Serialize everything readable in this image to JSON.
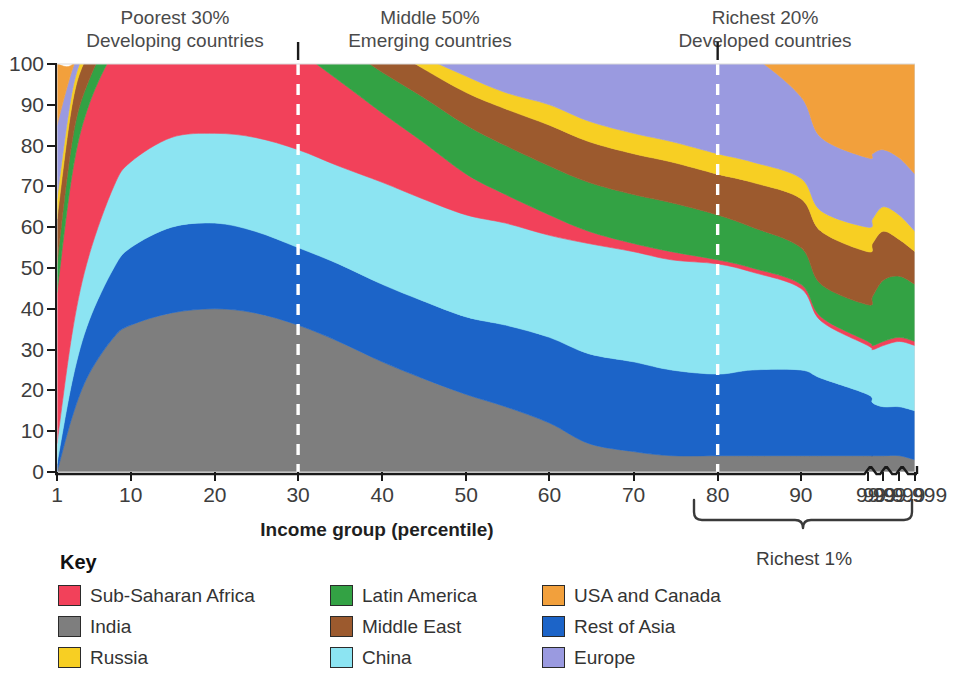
{
  "regions": [
    {
      "id": "poorest",
      "line1": "Poorest 30%",
      "line2": "Developing countries",
      "center_pct": 15
    },
    {
      "id": "middle",
      "line1": "Middle 50%",
      "line2": "Emerging countries",
      "center_pct": 55
    },
    {
      "id": "richest",
      "line1": "Richest 20%",
      "line2": "Developed countries",
      "center_pct": 90
    }
  ],
  "axis": {
    "x_title": "Income group (percentile)",
    "bracket_label": "Richest 1%"
  },
  "key": {
    "title": "Key",
    "items": [
      {
        "label": "Sub-Saharan Africa",
        "color": "#f2415a"
      },
      {
        "label": "Latin America",
        "color": "#33a244"
      },
      {
        "label": "USA and Canada",
        "color": "#f2a03c"
      },
      {
        "label": "India",
        "color": "#7e7e7e"
      },
      {
        "label": "Middle East",
        "color": "#9c5a2e"
      },
      {
        "label": "Rest of Asia",
        "color": "#1c64c8"
      },
      {
        "label": "Russia",
        "color": "#f7cf23"
      },
      {
        "label": "China",
        "color": "#8ce4f2"
      },
      {
        "label": "Europe",
        "color": "#9a9ae0"
      }
    ]
  },
  "chart_data": {
    "type": "area",
    "title": "",
    "subtitle": "",
    "xlabel": "Income group (percentile)",
    "ylabel": "",
    "ylim": [
      0,
      100
    ],
    "grid": false,
    "legend_position": "below",
    "stacked": true,
    "stack_total": 100,
    "x_tick_labels": [
      "1",
      "10",
      "20",
      "30",
      "40",
      "50",
      "60",
      "70",
      "80",
      "90",
      "99",
      "99.9",
      "99.99",
      "99.999"
    ],
    "x_tick_values": [
      1,
      10,
      20,
      30,
      40,
      50,
      60,
      70,
      80,
      90,
      99,
      99.9,
      99.99,
      99.999
    ],
    "y_tick_labels": [
      "0",
      "10",
      "20",
      "30",
      "40",
      "50",
      "60",
      "70",
      "80",
      "90",
      "100"
    ],
    "y_tick_values": [
      0,
      10,
      20,
      30,
      40,
      50,
      60,
      70,
      80,
      90,
      100
    ],
    "annotations": [
      {
        "text": "Poorest 30% / Developing countries",
        "x_range": [
          1,
          30
        ]
      },
      {
        "text": "Middle 50% / Emerging countries",
        "x_range": [
          30,
          80
        ]
      },
      {
        "text": "Richest 20% / Developed countries",
        "x_range": [
          80,
          99.999
        ]
      },
      {
        "text": "Richest 1%",
        "x_range": [
          99,
          99.999
        ],
        "style": "bracket"
      }
    ],
    "dividers": [
      {
        "at_x": 30,
        "style": "dashed-white"
      },
      {
        "at_x": 80,
        "style": "dashed-white"
      }
    ],
    "x": [
      1,
      3,
      5,
      8,
      10,
      15,
      20,
      25,
      30,
      35,
      40,
      45,
      50,
      55,
      60,
      65,
      70,
      75,
      80,
      85,
      90,
      95,
      99,
      99.5,
      99.9,
      99.99,
      99.999
    ],
    "series": [
      {
        "name": "India",
        "color": "#7e7e7e",
        "values": [
          0,
          14,
          24,
          33,
          36,
          39,
          40,
          39,
          36,
          32,
          27,
          23,
          19,
          16,
          12,
          7,
          5,
          4,
          4,
          4,
          4,
          4,
          4,
          4,
          4,
          4,
          3
        ]
      },
      {
        "name": "Rest of Asia",
        "color": "#1c64c8",
        "values": [
          2,
          9,
          13,
          17,
          19,
          21,
          21,
          20,
          19,
          19,
          19,
          19,
          19,
          20,
          21,
          22,
          22,
          21,
          20,
          21,
          21,
          19,
          15,
          13,
          12,
          12,
          12
        ]
      },
      {
        "name": "China",
        "color": "#8ce4f2",
        "values": [
          5,
          12,
          16,
          20,
          21,
          22,
          22,
          23,
          24,
          24,
          25,
          25,
          25,
          25,
          25,
          27,
          27,
          27,
          27,
          24,
          20,
          14,
          12,
          13,
          15,
          16,
          16
        ]
      },
      {
        "name": "Sub-Saharan Africa",
        "color": "#f2415a",
        "values": [
          37,
          39,
          37,
          33,
          31,
          29,
          28,
          26,
          24,
          21,
          17,
          14,
          10,
          7,
          5,
          3,
          2,
          2,
          1,
          1,
          1,
          1,
          1,
          1,
          1,
          1,
          1
        ]
      },
      {
        "name": "Latin America",
        "color": "#33a244",
        "values": [
          7,
          8,
          6,
          5,
          5,
          5,
          5,
          6,
          7,
          9,
          10,
          11,
          12,
          12,
          12,
          12,
          12,
          12,
          11,
          10,
          9,
          8,
          9,
          12,
          15,
          15,
          14
        ]
      },
      {
        "name": "Middle East",
        "color": "#9c5a2e",
        "values": [
          11,
          9,
          7,
          6,
          6,
          6,
          6,
          6,
          6,
          6,
          7,
          7,
          8,
          9,
          10,
          10,
          10,
          10,
          10,
          11,
          12,
          13,
          13,
          13,
          12,
          9,
          8
        ]
      },
      {
        "name": "Russia",
        "color": "#f7cf23",
        "values": [
          5,
          3,
          2,
          2,
          2,
          2,
          2,
          2,
          2,
          2,
          3,
          3,
          4,
          4,
          5,
          5,
          5,
          5,
          5,
          5,
          5,
          5,
          6,
          6,
          6,
          6,
          5
        ]
      },
      {
        "name": "Europe",
        "color": "#9a9ae0",
        "values": [
          18,
          5,
          3,
          3,
          3,
          3,
          3,
          4,
          5,
          6,
          8,
          11,
          14,
          17,
          19,
          21,
          23,
          25,
          27,
          26,
          20,
          18,
          17,
          16,
          14,
          14,
          14
        ]
      },
      {
        "name": "USA and Canada",
        "color": "#f2a03c",
        "values": [
          15,
          1,
          1,
          1,
          1,
          1,
          1,
          1,
          1,
          1,
          1,
          1,
          2,
          3,
          4,
          6,
          9,
          12,
          17,
          25,
          37,
          47,
          50,
          49,
          48,
          50,
          54
        ]
      }
    ]
  }
}
